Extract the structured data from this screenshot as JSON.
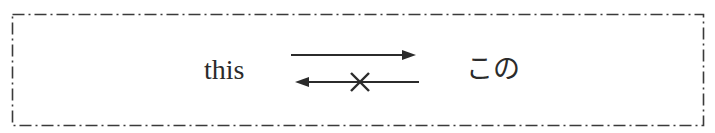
{
  "diagram": {
    "source_word": "this",
    "target_word": "この",
    "forward_arrow": {
      "direction": "right",
      "meaning": "mapping exists",
      "blocked": false
    },
    "backward_arrow": {
      "direction": "left",
      "meaning": "reverse mapping",
      "blocked": true,
      "marker": "×"
    },
    "border_style": "dash-dot",
    "colors": {
      "ink": "#2b2b2b",
      "background": "#ffffff"
    }
  }
}
